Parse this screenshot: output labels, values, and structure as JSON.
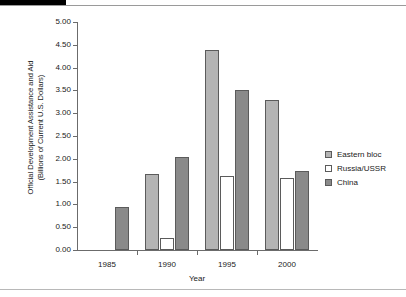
{
  "chart_data": {
    "type": "bar",
    "title": "",
    "xlabel": "Year",
    "ylabel": "Official Development Assistance and Aid (Billions of Current U.S. Dollars)",
    "ylabel_line1": "Official Development Assistance and Aid",
    "ylabel_line2": "(Billions of Current U.S. Dollars)",
    "categories": [
      "1985",
      "1990",
      "1995",
      "2000"
    ],
    "ylim": [
      0,
      5
    ],
    "ytick_step": 0.5,
    "ytick_labels": [
      "5.00",
      "4.50",
      "4.00",
      "3.50",
      "3.00",
      "2.50",
      "2.00",
      "1.50",
      "1.00",
      "0.50",
      "0.00"
    ],
    "ytick_values": [
      5.0,
      4.5,
      4.0,
      3.5,
      3.0,
      2.5,
      2.0,
      1.5,
      1.0,
      0.5,
      0.0
    ],
    "grid": false,
    "legend_position": "right",
    "series": [
      {
        "name": "Eastern bloc",
        "color": "#b4b4b4",
        "values": [
          null,
          1.67,
          4.39,
          3.29
        ]
      },
      {
        "name": "Russia/USSR",
        "color": "#ffffff",
        "values": [
          null,
          0.26,
          1.63,
          1.58
        ]
      },
      {
        "name": "China",
        "color": "#8a8a8a",
        "values": [
          0.95,
          2.04,
          3.5,
          1.73
        ]
      }
    ]
  },
  "legend": {
    "items": [
      {
        "label": "Eastern bloc",
        "swatch": "eastern"
      },
      {
        "label": "Russia/USSR",
        "swatch": "russia"
      },
      {
        "label": "China",
        "swatch": "china"
      }
    ]
  },
  "colors": {
    "eastern_bloc": "#b4b4b4",
    "russia_ussr": "#ffffff",
    "china": "#8a8a8a",
    "axis": "#6b6b6b",
    "bar_outline": "#5b5b5b",
    "text": "#1a1a1a"
  }
}
